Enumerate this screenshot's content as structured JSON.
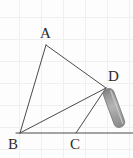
{
  "figure": {
    "kind": "geometry-diagram",
    "canvas": {
      "width": 133,
      "height": 158,
      "background": "#fdfdfd"
    },
    "grid": {
      "visible": true,
      "spacing": 22,
      "color": "#f0f0ef"
    },
    "style": {
      "line_color": "#4a4a4a",
      "line_width": 1,
      "label_color": "#2b2b2b",
      "label_font_size": 15
    },
    "points": [
      {
        "id": "A",
        "label": "A",
        "x": 46,
        "y": 45,
        "label_x": 40,
        "label_y": 26
      },
      {
        "id": "B",
        "label": "B",
        "x": 20,
        "y": 133,
        "label_x": 8,
        "label_y": 137
      },
      {
        "id": "C",
        "label": "C",
        "x": 76,
        "y": 133,
        "label_x": 70,
        "label_y": 137
      },
      {
        "id": "D",
        "label": "D",
        "x": 106,
        "y": 88,
        "label_x": 108,
        "label_y": 69
      }
    ],
    "segments": [
      {
        "name": "segment-AB",
        "from": "A",
        "to": "B"
      },
      {
        "name": "segment-AD",
        "from": "A",
        "to": "D"
      },
      {
        "name": "segment-BD",
        "from": "B",
        "to": "D"
      },
      {
        "name": "segment-CD",
        "from": "C",
        "to": "D"
      }
    ],
    "baseline": {
      "name": "baseline-through-B-and-C",
      "x1": 16,
      "y1": 133,
      "x2": 133,
      "y2": 133
    },
    "pencil": {
      "name": "pencil",
      "description": "gray shaded pencil-like bar resting at point D",
      "tip_x": 107,
      "tip_y": 89,
      "end_x": 121,
      "end_y": 127,
      "width": 11,
      "colors": {
        "edge_dark": "#8e8e8e",
        "body_mid": "#a8a8a8",
        "highlight": "#c9c9c9",
        "outline": "#6f6f6f"
      }
    }
  }
}
